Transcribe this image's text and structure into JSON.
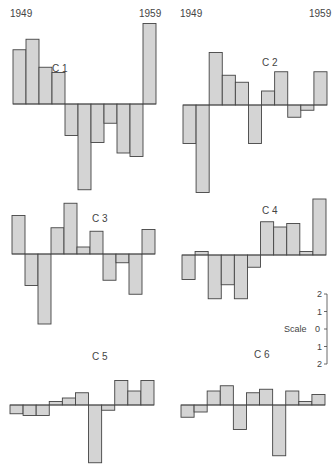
{
  "figure": {
    "year_start_label": "1949",
    "year_end_label": "1959",
    "scale": {
      "label": "Scale",
      "ticks": [
        "2",
        "1",
        "0",
        "1",
        "2"
      ]
    },
    "fill_color": "#d4d4d4",
    "stroke_color": "#444444"
  },
  "chart_data": [
    {
      "type": "bar",
      "title": "C 1",
      "categories": [
        "1949",
        "1950",
        "1951",
        "1952",
        "1953",
        "1954",
        "1955",
        "1956",
        "1957",
        "1958",
        "1959"
      ],
      "values": [
        3.1,
        3.7,
        2.1,
        1.8,
        -1.8,
        -4.9,
        -2.2,
        -1.1,
        -2.8,
        -3.0,
        4.6
      ],
      "ylim": [
        -5,
        5
      ],
      "grid": false
    },
    {
      "type": "bar",
      "title": "C 2",
      "categories": [
        "1949",
        "1950",
        "1951",
        "1952",
        "1953",
        "1954",
        "1955",
        "1956",
        "1957",
        "1958",
        "1959"
      ],
      "values": [
        -2.2,
        -5.0,
        3.0,
        1.7,
        1.3,
        -2.2,
        0.8,
        1.9,
        -0.7,
        -0.3,
        1.9
      ],
      "ylim": [
        -5,
        5
      ],
      "grid": false
    },
    {
      "type": "bar",
      "title": "C 3",
      "categories": [
        "1949",
        "1950",
        "1951",
        "1952",
        "1953",
        "1954",
        "1955",
        "1956",
        "1957",
        "1958",
        "1959"
      ],
      "values": [
        2.2,
        -1.8,
        -4.0,
        1.5,
        2.9,
        0.4,
        1.3,
        -1.5,
        -0.5,
        -2.3,
        1.4
      ],
      "ylim": [
        -5,
        5
      ],
      "grid": false
    },
    {
      "type": "bar",
      "title": "C 4",
      "categories": [
        "1949",
        "1950",
        "1951",
        "1952",
        "1953",
        "1954",
        "1955",
        "1956",
        "1957",
        "1958",
        "1959"
      ],
      "values": [
        -1.4,
        0.2,
        -2.5,
        -1.7,
        -2.5,
        -0.7,
        1.9,
        1.6,
        1.8,
        0.2,
        3.2
      ],
      "ylim": [
        -5,
        5
      ],
      "grid": false
    },
    {
      "type": "bar",
      "title": "C 5",
      "categories": [
        "1949",
        "1950",
        "1951",
        "1952",
        "1953",
        "1954",
        "1955",
        "1956",
        "1957",
        "1958",
        "1959"
      ],
      "values": [
        -0.5,
        -0.6,
        -0.6,
        0.2,
        0.4,
        0.7,
        -3.3,
        -0.3,
        1.4,
        0.8,
        1.4
      ],
      "ylim": [
        -5,
        5
      ],
      "grid": false
    },
    {
      "type": "bar",
      "title": "C 6",
      "categories": [
        "1949",
        "1950",
        "1951",
        "1952",
        "1953",
        "1954",
        "1955",
        "1956",
        "1957",
        "1958",
        "1959"
      ],
      "values": [
        -0.7,
        -0.4,
        0.8,
        1.1,
        -1.4,
        0.7,
        0.9,
        -2.9,
        0.8,
        0.2,
        0.6
      ],
      "ylim": [
        -5,
        5
      ],
      "grid": false
    }
  ],
  "panels": [
    {
      "label": "C 1"
    },
    {
      "label": "C 2"
    },
    {
      "label": "C 3"
    },
    {
      "label": "C 4"
    },
    {
      "label": "C 5"
    },
    {
      "label": "C 6"
    }
  ]
}
